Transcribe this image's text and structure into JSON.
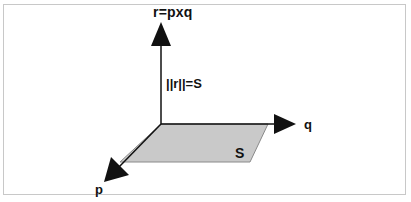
{
  "diagram": {
    "type": "cross-product-vector-diagram",
    "labels": {
      "r_vector": "r=pxq",
      "magnitude": "||r||=S",
      "q_vector": "q",
      "p_vector": "p",
      "area": "S"
    },
    "colors": {
      "stroke": "#111111",
      "parallelogram_fill": "#c9c9c9",
      "parallelogram_edge": "#8a8a8a",
      "frame_border": "#c8c8c8",
      "background": "#ffffff"
    },
    "geometry": {
      "origin": [
        161,
        124
      ],
      "r_tip": [
        161,
        22
      ],
      "q_tip": [
        296,
        124
      ],
      "p_tip": [
        104,
        182
      ],
      "parallelogram": [
        [
          161,
          124
        ],
        [
          268,
          124
        ],
        [
          250,
          162
        ],
        [
          120,
          162
        ]
      ]
    }
  }
}
